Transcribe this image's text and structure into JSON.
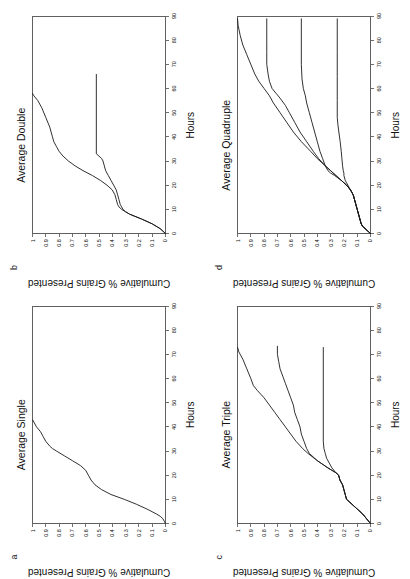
{
  "figure": {
    "rotation_note": "figure printed sideways (rotated 90 deg counter-clockwise)",
    "ink_color": "#1a1a1a",
    "background": "#ffffff"
  },
  "axes": {
    "xlabel": "Hours",
    "ylabel": "Cumulative % Grains Presented",
    "xticks": [
      0,
      10,
      20,
      30,
      40,
      50,
      60,
      70,
      80,
      90
    ],
    "yticks": [
      "0",
      "0.1",
      "0.2",
      "0.3",
      "0.4",
      "0.5",
      "0.6",
      "0.7",
      "0.8",
      "0.9",
      "1"
    ],
    "xlim": [
      0,
      90
    ],
    "ylim": [
      0,
      1
    ]
  },
  "panels": [
    {
      "letter": "a",
      "title": "Average Single",
      "position": "top-left"
    },
    {
      "letter": "b",
      "title": "Average Double",
      "position": "top-right"
    },
    {
      "letter": "c",
      "title": "Average Triple",
      "position": "bottom-left"
    },
    {
      "letter": "d",
      "title": "Average Quadruple",
      "position": "bottom-right"
    }
  ],
  "chart_data": [
    {
      "type": "line",
      "panel": "a",
      "title": "Average Single",
      "xlabel": "Hours",
      "ylabel": "Cumulative % Grains Presented",
      "xlim": [
        0,
        90
      ],
      "ylim": [
        0,
        1
      ],
      "grid": false,
      "legend": "none",
      "series": [
        {
          "name": "single",
          "x": [
            0,
            1,
            2,
            3,
            4,
            6,
            8,
            10,
            12,
            14,
            16,
            18,
            20,
            22,
            24,
            26,
            28,
            30,
            31,
            32,
            34,
            36,
            38,
            40,
            42,
            43
          ],
          "y": [
            0,
            0.01,
            0.02,
            0.04,
            0.07,
            0.14,
            0.22,
            0.31,
            0.41,
            0.48,
            0.53,
            0.56,
            0.58,
            0.6,
            0.64,
            0.7,
            0.76,
            0.82,
            0.85,
            0.87,
            0.9,
            0.92,
            0.94,
            0.97,
            0.99,
            1.0
          ]
        }
      ]
    },
    {
      "type": "line",
      "panel": "b",
      "title": "Average Double",
      "xlabel": "Hours",
      "ylabel": "Cumulative % Grains Presented",
      "xlim": [
        0,
        90
      ],
      "ylim": [
        0,
        1
      ],
      "grid": false,
      "legend": "none",
      "series": [
        {
          "name": "double-upper",
          "x": [
            0,
            2,
            4,
            6,
            8,
            9,
            10,
            11,
            12,
            14,
            16,
            18,
            20,
            22,
            24,
            26,
            28,
            30,
            32,
            34,
            36,
            38,
            40,
            44,
            48,
            52,
            55,
            57,
            58
          ],
          "y": [
            0,
            0.04,
            0.1,
            0.18,
            0.27,
            0.3,
            0.33,
            0.35,
            0.36,
            0.37,
            0.38,
            0.4,
            0.44,
            0.49,
            0.55,
            0.62,
            0.68,
            0.73,
            0.77,
            0.8,
            0.82,
            0.84,
            0.85,
            0.87,
            0.9,
            0.93,
            0.96,
            0.99,
            1.0
          ]
        },
        {
          "name": "double-lower",
          "x": [
            0,
            2,
            4,
            6,
            8,
            9,
            10,
            11,
            12,
            14,
            16,
            18,
            20,
            22,
            24,
            26,
            28,
            30,
            31,
            32,
            33,
            66
          ],
          "y": [
            0,
            0.04,
            0.1,
            0.18,
            0.27,
            0.3,
            0.32,
            0.33,
            0.34,
            0.35,
            0.36,
            0.37,
            0.39,
            0.41,
            0.43,
            0.45,
            0.46,
            0.47,
            0.48,
            0.5,
            0.52,
            0.52
          ]
        }
      ]
    },
    {
      "type": "line",
      "panel": "c",
      "title": "Average Triple",
      "xlabel": "Hours",
      "ylabel": "Cumulative % Grains Presented",
      "xlim": [
        0,
        90
      ],
      "ylim": [
        0,
        1
      ],
      "grid": false,
      "legend": "none",
      "series": [
        {
          "name": "triple-upper",
          "x": [
            0,
            2,
            4,
            6,
            8,
            10,
            12,
            14,
            16,
            18,
            20,
            21,
            23,
            26,
            29,
            31,
            34,
            37,
            40,
            43,
            46,
            49,
            52,
            55,
            57,
            60,
            64,
            68,
            71,
            73
          ],
          "y": [
            0,
            0.03,
            0.06,
            0.1,
            0.14,
            0.18,
            0.19,
            0.2,
            0.21,
            0.23,
            0.24,
            0.26,
            0.32,
            0.4,
            0.47,
            0.51,
            0.56,
            0.6,
            0.64,
            0.68,
            0.72,
            0.76,
            0.8,
            0.85,
            0.88,
            0.9,
            0.93,
            0.96,
            0.99,
            1.0
          ]
        },
        {
          "name": "triple-middle",
          "x": [
            0,
            2,
            4,
            6,
            8,
            10,
            12,
            14,
            16,
            18,
            20,
            21,
            23,
            26,
            29,
            31,
            34,
            37,
            40,
            43,
            46,
            49,
            52,
            55,
            58,
            61,
            64,
            67,
            70,
            73,
            73.5
          ],
          "y": [
            0,
            0.03,
            0.06,
            0.1,
            0.14,
            0.18,
            0.19,
            0.2,
            0.21,
            0.23,
            0.24,
            0.26,
            0.32,
            0.4,
            0.46,
            0.48,
            0.5,
            0.52,
            0.53,
            0.55,
            0.57,
            0.58,
            0.6,
            0.62,
            0.64,
            0.66,
            0.68,
            0.69,
            0.7,
            0.7,
            0.7
          ]
        },
        {
          "name": "triple-lower",
          "x": [
            0,
            2,
            4,
            6,
            8,
            10,
            12,
            14,
            16,
            18,
            20,
            21,
            23,
            25,
            27,
            29,
            31,
            34,
            73
          ],
          "y": [
            0,
            0.03,
            0.06,
            0.1,
            0.14,
            0.18,
            0.19,
            0.2,
            0.21,
            0.23,
            0.24,
            0.26,
            0.29,
            0.31,
            0.33,
            0.34,
            0.35,
            0.355,
            0.355
          ]
        }
      ]
    },
    {
      "type": "line",
      "panel": "d",
      "title": "Average Quadruple",
      "xlabel": "Hours",
      "ylabel": "Cumulative % Grains Presented",
      "xlim": [
        0,
        90
      ],
      "ylim": [
        0,
        1
      ],
      "grid": false,
      "legend": "none",
      "series": [
        {
          "name": "quad-1",
          "x": [
            0,
            1,
            2,
            3,
            4,
            6,
            8,
            10,
            12,
            14,
            16,
            18,
            20,
            21,
            22,
            24,
            26,
            28,
            31,
            34,
            38,
            42,
            46,
            50,
            54,
            57,
            60,
            63,
            66,
            70,
            74,
            78,
            82,
            86,
            89
          ],
          "y": [
            0,
            0.02,
            0.04,
            0.06,
            0.07,
            0.08,
            0.09,
            0.1,
            0.11,
            0.12,
            0.13,
            0.15,
            0.18,
            0.2,
            0.22,
            0.26,
            0.3,
            0.34,
            0.4,
            0.45,
            0.52,
            0.58,
            0.63,
            0.68,
            0.73,
            0.76,
            0.8,
            0.84,
            0.87,
            0.9,
            0.93,
            0.96,
            0.98,
            0.995,
            1.0
          ]
        },
        {
          "name": "quad-2",
          "x": [
            0,
            1,
            2,
            3,
            4,
            6,
            8,
            10,
            12,
            14,
            16,
            18,
            20,
            21,
            22,
            24,
            26,
            28,
            31,
            34,
            38,
            42,
            46,
            50,
            53,
            56,
            58,
            60,
            63,
            66,
            70,
            75,
            80,
            85,
            89
          ],
          "y": [
            0,
            0.02,
            0.04,
            0.06,
            0.07,
            0.08,
            0.09,
            0.1,
            0.11,
            0.12,
            0.13,
            0.15,
            0.18,
            0.2,
            0.22,
            0.26,
            0.3,
            0.34,
            0.39,
            0.43,
            0.48,
            0.53,
            0.57,
            0.61,
            0.64,
            0.68,
            0.71,
            0.74,
            0.76,
            0.77,
            0.78,
            0.78,
            0.78,
            0.78,
            0.78
          ]
        },
        {
          "name": "quad-3",
          "x": [
            0,
            1,
            2,
            3,
            4,
            6,
            8,
            10,
            12,
            14,
            16,
            18,
            20,
            21,
            22,
            24,
            25,
            26,
            28,
            31,
            34,
            38,
            42,
            46,
            50,
            54,
            57,
            60,
            64,
            70,
            78,
            85,
            89
          ],
          "y": [
            0,
            0.02,
            0.04,
            0.06,
            0.07,
            0.08,
            0.09,
            0.1,
            0.11,
            0.12,
            0.13,
            0.15,
            0.18,
            0.2,
            0.22,
            0.27,
            0.3,
            0.32,
            0.34,
            0.36,
            0.38,
            0.4,
            0.42,
            0.44,
            0.46,
            0.48,
            0.49,
            0.505,
            0.515,
            0.52,
            0.52,
            0.52,
            0.52
          ]
        },
        {
          "name": "quad-4",
          "x": [
            0,
            1,
            2,
            3,
            4,
            6,
            8,
            10,
            12,
            14,
            16,
            18,
            20,
            21,
            22,
            24,
            25,
            26,
            28,
            31,
            34,
            38,
            42,
            45,
            48,
            55,
            65,
            75,
            85,
            89
          ],
          "y": [
            0,
            0.02,
            0.04,
            0.06,
            0.07,
            0.08,
            0.09,
            0.1,
            0.11,
            0.12,
            0.13,
            0.15,
            0.17,
            0.18,
            0.19,
            0.2,
            0.2,
            0.205,
            0.21,
            0.215,
            0.22,
            0.228,
            0.238,
            0.245,
            0.25,
            0.25,
            0.25,
            0.25,
            0.25,
            0.25
          ]
        }
      ]
    }
  ]
}
